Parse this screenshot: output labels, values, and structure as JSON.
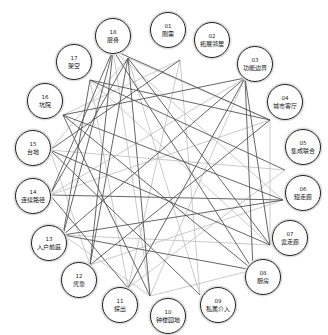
{
  "diagram": {
    "type": "circular-network",
    "line_colors": {
      "dark": "#555555",
      "light": "#bdbdbd"
    },
    "nodes": [
      {
        "id": "01",
        "label": "刚需",
        "cx": 168,
        "cy": 30,
        "ax": 113,
        "ay": 50
      },
      {
        "id": "02",
        "label": "拓展邻居",
        "cx": 212,
        "cy": 40,
        "ax": 180,
        "ay": 60
      },
      {
        "id": "03",
        "label": "功能边界",
        "cx": 255,
        "cy": 64,
        "ax": 245,
        "ay": 78
      },
      {
        "id": "04",
        "label": "城市客厅",
        "cx": 285,
        "cy": 102,
        "ax": 270,
        "ay": 120
      },
      {
        "id": "05",
        "label": "集成联合",
        "cx": 303,
        "cy": 147,
        "ax": 285,
        "ay": 170
      },
      {
        "id": "06",
        "label": "短走廊",
        "cx": 303,
        "cy": 193,
        "ax": 283,
        "ay": 200
      },
      {
        "id": "07",
        "label": "宽走廊",
        "cx": 290,
        "cy": 238,
        "ax": 270,
        "ay": 245
      },
      {
        "id": "08",
        "label": "厨房",
        "cx": 263,
        "cy": 277,
        "ax": 253,
        "ay": 270
      },
      {
        "id": "09",
        "label": "私属介入",
        "cx": 218,
        "cy": 305,
        "ax": 200,
        "ay": 295
      },
      {
        "id": "10",
        "label": "钟楼园地",
        "cx": 168,
        "cy": 316,
        "ax": 150,
        "ay": 296
      },
      {
        "id": "11",
        "label": "探出",
        "cx": 120,
        "cy": 305,
        "ax": 128,
        "ay": 288
      },
      {
        "id": "12",
        "label": "凭靠",
        "cx": 79,
        "cy": 280,
        "ax": 90,
        "ay": 265
      },
      {
        "id": "13",
        "label": "入户前庭",
        "cx": 49,
        "cy": 243,
        "ax": 63,
        "ay": 235
      },
      {
        "id": "14",
        "label": "连续路径",
        "cx": 33,
        "cy": 196,
        "ax": 50,
        "ay": 195
      },
      {
        "id": "15",
        "label": "台地",
        "cx": 33,
        "cy": 148,
        "ax": 50,
        "ay": 150
      },
      {
        "id": "16",
        "label": "坑院",
        "cx": 45,
        "cy": 101,
        "ax": 63,
        "ay": 115
      },
      {
        "id": "17",
        "label": "架空",
        "cx": 74,
        "cy": 62,
        "ax": 90,
        "ay": 80
      },
      {
        "id": "18",
        "label": "层叠",
        "cx": 113,
        "cy": 36,
        "ax": 128,
        "ay": 58
      }
    ],
    "edges": [
      {
        "from": "01",
        "to": "04",
        "tone": "dark"
      },
      {
        "from": "01",
        "to": "08",
        "tone": "dark"
      },
      {
        "from": "01",
        "to": "12",
        "tone": "dark"
      },
      {
        "from": "01",
        "to": "13",
        "tone": "dark"
      },
      {
        "from": "01",
        "to": "14",
        "tone": "dark"
      },
      {
        "from": "01",
        "to": "10",
        "tone": "light"
      },
      {
        "from": "01",
        "to": "06",
        "tone": "light"
      },
      {
        "from": "02",
        "to": "15",
        "tone": "dark"
      },
      {
        "from": "02",
        "to": "11",
        "tone": "light"
      },
      {
        "from": "02",
        "to": "09",
        "tone": "light"
      },
      {
        "from": "03",
        "to": "16",
        "tone": "dark"
      },
      {
        "from": "03",
        "to": "13",
        "tone": "dark"
      },
      {
        "from": "03",
        "to": "11",
        "tone": "dark"
      },
      {
        "from": "03",
        "to": "10",
        "tone": "light"
      },
      {
        "from": "03",
        "to": "08",
        "tone": "dark"
      },
      {
        "from": "03",
        "to": "07",
        "tone": "dark"
      },
      {
        "from": "03",
        "to": "14",
        "tone": "light"
      },
      {
        "from": "04",
        "to": "17",
        "tone": "dark"
      },
      {
        "from": "04",
        "to": "12",
        "tone": "dark"
      },
      {
        "from": "04",
        "to": "07",
        "tone": "light"
      },
      {
        "from": "04",
        "to": "14",
        "tone": "light"
      },
      {
        "from": "05",
        "to": "15",
        "tone": "light"
      },
      {
        "from": "05",
        "to": "17",
        "tone": "dark"
      },
      {
        "from": "05",
        "to": "11",
        "tone": "light"
      },
      {
        "from": "06",
        "to": "14",
        "tone": "dark"
      },
      {
        "from": "06",
        "to": "16",
        "tone": "dark"
      },
      {
        "from": "06",
        "to": "12",
        "tone": "light"
      },
      {
        "from": "06",
        "to": "13",
        "tone": "dark"
      },
      {
        "from": "07",
        "to": "15",
        "tone": "dark"
      },
      {
        "from": "07",
        "to": "18",
        "tone": "dark"
      },
      {
        "from": "07",
        "to": "13",
        "tone": "light"
      },
      {
        "from": "08",
        "to": "16",
        "tone": "dark"
      },
      {
        "from": "08",
        "to": "13",
        "tone": "dark"
      },
      {
        "from": "08",
        "to": "10",
        "tone": "light"
      },
      {
        "from": "09",
        "to": "18",
        "tone": "light"
      },
      {
        "from": "09",
        "to": "15",
        "tone": "dark"
      },
      {
        "from": "10",
        "to": "16",
        "tone": "dark"
      },
      {
        "from": "10",
        "to": "18",
        "tone": "dark"
      },
      {
        "from": "10",
        "to": "13",
        "tone": "light"
      },
      {
        "from": "11",
        "to": "17",
        "tone": "light"
      },
      {
        "from": "11",
        "to": "14",
        "tone": "dark"
      },
      {
        "from": "12",
        "to": "18",
        "tone": "dark"
      },
      {
        "from": "12",
        "to": "15",
        "tone": "light"
      },
      {
        "from": "13",
        "to": "17",
        "tone": "dark"
      },
      {
        "from": "14",
        "to": "18",
        "tone": "dark"
      },
      {
        "from": "15",
        "to": "18",
        "tone": "light"
      },
      {
        "from": "16",
        "to": "02",
        "tone": "light"
      },
      {
        "from": "17",
        "to": "07",
        "tone": "light"
      },
      {
        "from": "18",
        "to": "04",
        "tone": "light"
      }
    ]
  }
}
